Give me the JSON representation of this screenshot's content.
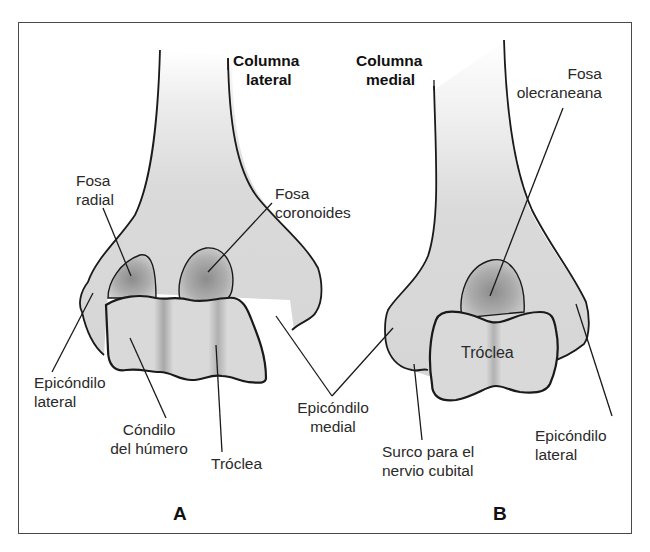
{
  "figure": {
    "colors": {
      "bone_fill": "#d9d9d9",
      "fossa_fill": "#9a9a9a",
      "outline": "#1a1a1a",
      "frame": "#4a4a4a",
      "text": "#2a2a2a"
    },
    "panels": [
      {
        "letter": "A",
        "labels": {
          "columna_lateral": [
            "Columna",
            "lateral"
          ],
          "fosa_radial": [
            "Fosa",
            "radial"
          ],
          "fosa_coronoides": [
            "Fosa",
            "coronoides"
          ],
          "epicondilo_lateral": [
            "Epicóndilo",
            "lateral"
          ],
          "condilo_humero": [
            "Cóndilo",
            "del húmero"
          ],
          "troclea": "Tróclea"
        }
      },
      {
        "letter": "B",
        "labels": {
          "columna_medial": [
            "Columna",
            "medial"
          ],
          "fosa_olecraneana": [
            "Fosa",
            "olecraneana"
          ],
          "troclea": "Tróclea",
          "surco_nervio_cubital": [
            "Surco para el",
            "nervio cubital"
          ],
          "epicondilo_lateral": [
            "Epicóndilo",
            "lateral"
          ]
        }
      }
    ],
    "shared_labels": {
      "epicondilo_medial": [
        "Epicóndilo",
        "medial"
      ]
    }
  }
}
